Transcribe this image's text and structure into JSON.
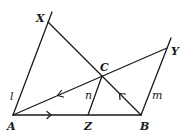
{
  "figure": {
    "type": "geometry",
    "points": {
      "A": {
        "label": "A",
        "x": 13,
        "y": 115
      },
      "B": {
        "label": "B",
        "x": 141,
        "y": 115
      },
      "Z": {
        "label": "Z",
        "x": 88,
        "y": 115
      },
      "C": {
        "label": "C",
        "x": 102,
        "y": 76
      },
      "X": {
        "label": "X",
        "x": 48,
        "y": 22
      },
      "Y": {
        "label": "Y",
        "x": 167,
        "y": 48
      }
    },
    "lines": {
      "l": {
        "label": "l",
        "through": [
          "A",
          "X"
        ]
      },
      "m": {
        "label": "m",
        "through": [
          "B",
          "Y"
        ]
      },
      "n": {
        "label": "n",
        "through": [
          "Z",
          "C"
        ]
      }
    },
    "segments": [
      {
        "from": "A",
        "to": "B"
      },
      {
        "from": "A",
        "to": "Y",
        "through": "C"
      },
      {
        "from": "X",
        "to": "B",
        "through": "C"
      }
    ],
    "parallel_marks": [
      {
        "segment": "AZ",
        "direction": "right"
      },
      {
        "segment": "CA",
        "direction": "toward A"
      },
      {
        "segment": "BC",
        "direction": "toward C"
      }
    ]
  }
}
